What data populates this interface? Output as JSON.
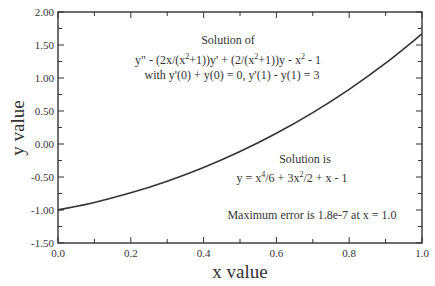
{
  "chart_data": {
    "type": "line",
    "title": "",
    "xlabel": "x value",
    "ylabel": "y value",
    "xlim": [
      0.0,
      1.0
    ],
    "ylim": [
      -1.5,
      2.0
    ],
    "grid": false,
    "legend": "none",
    "x_ticks": [
      "0.0",
      "0.2",
      "0.4",
      "0.6",
      "0.8",
      "1.0"
    ],
    "y_ticks": [
      "-1.50",
      "-1.00",
      "-0.50",
      "0.00",
      "0.50",
      "1.00",
      "1.50",
      "2.00"
    ],
    "series": [
      {
        "name": "Solution",
        "x": [
          0.0,
          0.1,
          0.2,
          0.3,
          0.4,
          0.5,
          0.6,
          0.7,
          0.8,
          0.9,
          1.0
        ],
        "values": [
          -1.0,
          -0.885,
          -0.74,
          -0.564,
          -0.356,
          -0.115,
          0.162,
          0.475,
          0.828,
          1.224,
          1.667
        ]
      }
    ],
    "annotations": {
      "problem_title": "Solution of",
      "equation_parts": [
        "y\" - (2x/(x",
        "2",
        "+1))y' + (2/(x",
        "2",
        "+1))y - x",
        "2",
        " - 1"
      ],
      "boundary_conditions": "with y'(0) + y(0) = 0,  y'(1) - y(1) = 3",
      "solution_title": "Solution is",
      "solution_parts": [
        "y = x",
        "4",
        "/6 + 3x",
        "2",
        "/2 + x - 1"
      ],
      "error_note": "Maximum error is 1.8e-7 at x = 1.0"
    }
  }
}
